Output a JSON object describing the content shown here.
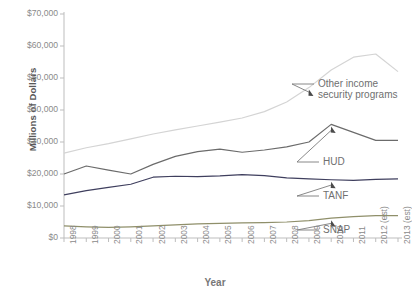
{
  "chart_data": {
    "type": "line",
    "title": "",
    "xlabel": "Year",
    "ylabel": "Millions of Dollars",
    "ylim": [
      0,
      70000
    ],
    "ytick_labels": [
      "$70,000",
      "$60,000",
      "$50,000",
      "$40,000",
      "$30,000",
      "$20,000",
      "$10,000",
      "$0"
    ],
    "ytick_values": [
      70000,
      60000,
      50000,
      40000,
      30000,
      20000,
      10000,
      0
    ],
    "grid": false,
    "legend_position": "inline-annotations",
    "categories": [
      "1998",
      "1999",
      "2000",
      "2001",
      "2002",
      "2003",
      "2004",
      "2005",
      "2006",
      "2007",
      "2008",
      "2009",
      "2010",
      "2011",
      "2012 (est)",
      "2013 (est)"
    ],
    "series": [
      {
        "name": "Other income security programs",
        "color": "#d4d4d4",
        "values": [
          26500,
          28200,
          29500,
          31000,
          32500,
          33800,
          35000,
          36200,
          37500,
          39500,
          42500,
          47000,
          52500,
          56500,
          57500,
          52000
        ]
      },
      {
        "name": "HUD",
        "color": "#6b6b6b",
        "values": [
          20000,
          22500,
          21200,
          20000,
          23000,
          25500,
          27000,
          27800,
          26800,
          27500,
          28500,
          30000,
          35500,
          33000,
          30500,
          30500
        ]
      },
      {
        "name": "TANF",
        "color": "#3f3f5e",
        "values": [
          13500,
          14800,
          15800,
          16800,
          19000,
          19300,
          19200,
          19400,
          19800,
          19500,
          18800,
          18500,
          18200,
          18000,
          18300,
          18500
        ]
      },
      {
        "name": "SNAP",
        "color": "#8f8f6a",
        "values": [
          3800,
          3500,
          3300,
          3500,
          3800,
          4100,
          4400,
          4600,
          4700,
          4800,
          5000,
          5400,
          6200,
          6700,
          7000,
          7000
        ]
      }
    ],
    "annotations": [
      {
        "label": "Other income security programs",
        "target_year": "2009",
        "label_x": 318,
        "label_y": 78
      },
      {
        "label": "HUD",
        "target_year": "2010",
        "label_x": 323,
        "label_y": 156
      },
      {
        "label": "TANF",
        "target_year": "2010",
        "label_x": 323,
        "label_y": 190
      },
      {
        "label": "SNAP",
        "target_year": "2010",
        "label_x": 323,
        "label_y": 224
      }
    ]
  },
  "axes": {
    "y_title": "Millions of Dollars",
    "x_title": "Year"
  }
}
